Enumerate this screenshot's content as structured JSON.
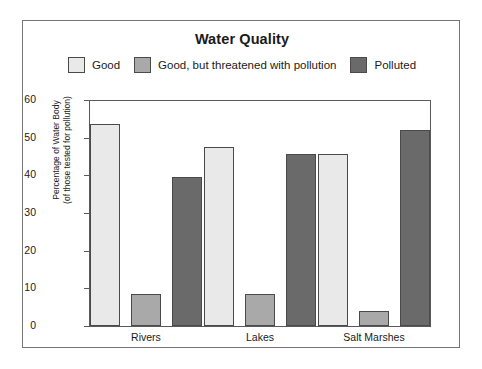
{
  "chart_data": {
    "type": "bar",
    "title": "Water Quality",
    "xlabel": "",
    "ylabel": "Percentage of Water Body (of those tested for pollution)",
    "ylabel_line1": "Percentage of Water Body",
    "ylabel_line2": "(of those tested for pollution)",
    "categories": [
      "Rivers",
      "Lakes",
      "Salt Marshes"
    ],
    "series": [
      {
        "name": "Good",
        "color": "#e9e9e9",
        "values": [
          53.5,
          47.5,
          45.8
        ]
      },
      {
        "name": "Good, but threatened with pollution",
        "color": "#a9a9a9",
        "values": [
          8.5,
          8.5,
          4.0
        ]
      },
      {
        "name": "Polluted",
        "color": "#6a6a6a",
        "values": [
          39.5,
          45.8,
          52.0
        ]
      }
    ],
    "ylim": [
      0,
      60
    ],
    "yticks": [
      0,
      10,
      20,
      30,
      40,
      50,
      60
    ],
    "ytick_labels": [
      "0",
      "10",
      "20",
      "30",
      "40",
      "50",
      "60"
    ],
    "grid": false,
    "legend_position": "top"
  },
  "legend": [
    {
      "label": "Good",
      "color": "#e9e9e9"
    },
    {
      "label": "Good, but threatened with pollution",
      "color": "#a9a9a9"
    },
    {
      "label": "Polluted",
      "color": "#6a6a6a"
    }
  ],
  "frame": {
    "border_color": "#767676",
    "axis_color": "#5a5a5a",
    "text_color": "#1a1a1a"
  }
}
